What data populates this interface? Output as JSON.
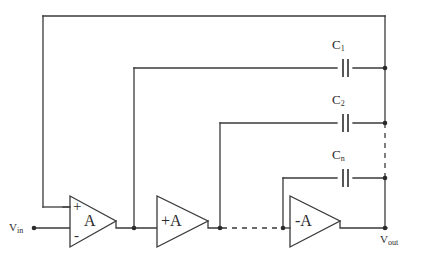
{
  "diagram": {
    "ports": {
      "input": {
        "name": "V",
        "subscript": "in"
      },
      "output": {
        "name": "V",
        "subscript": "out"
      }
    },
    "amplifiers": [
      {
        "id": "amp1",
        "gain_label": "A",
        "plus_terminal": "+",
        "minus_terminal": "-",
        "style": "differential"
      },
      {
        "id": "amp2",
        "gain_label": "+A",
        "style": "single"
      },
      {
        "id": "amp3",
        "gain_label": "-A",
        "style": "single"
      }
    ],
    "capacitors": [
      {
        "id": "c1",
        "name": "C",
        "subscript": "1",
        "label": "C1"
      },
      {
        "id": "c2",
        "name": "C",
        "subscript": "2",
        "label": "C2"
      },
      {
        "id": "cn",
        "name": "C",
        "subscript": "n",
        "label": "Cn"
      }
    ],
    "ellipsis_notes": {
      "vertical_bus": "dashed between C2 and Cn nodes",
      "signal_path": "dashed between amp2 output and amp3 input"
    },
    "colors": {
      "wire": "#3a3a3a",
      "node": "#2b2b2b",
      "background": "#ffffff",
      "text": "#2b2b2b"
    }
  }
}
